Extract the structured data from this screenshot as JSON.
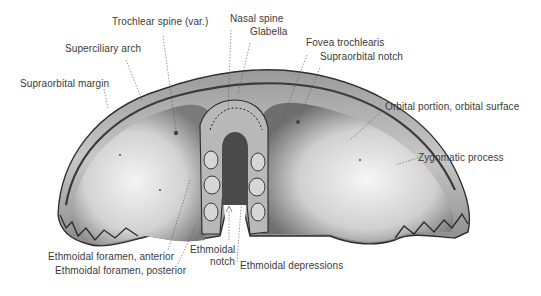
{
  "figure": {
    "labels": [
      {
        "id": "trochlear-spine",
        "text": "Trochlear spine (var.)",
        "x": 112,
        "y": 21
      },
      {
        "id": "nasal-spine",
        "text": "Nasal spine",
        "x": 232,
        "y": 18
      },
      {
        "id": "glabella",
        "text": "Glabella",
        "x": 250,
        "y": 31
      },
      {
        "id": "superciliary-arch",
        "text": "Superciliary arch",
        "x": 65,
        "y": 48
      },
      {
        "id": "fovea-trochlearis",
        "text": "Fovea trochlearis",
        "x": 306,
        "y": 42
      },
      {
        "id": "supraorbital-notch",
        "text": "Supraorbital notch",
        "x": 320,
        "y": 56
      },
      {
        "id": "supraorbital-margin",
        "text": "Supraorbital margin",
        "x": 20,
        "y": 78
      },
      {
        "id": "orbital-portion",
        "text": "Orbital portion, orbital surface",
        "x": 385,
        "y": 103
      },
      {
        "id": "zygomatic-process",
        "text": "Zygomatic process",
        "x": 419,
        "y": 152
      },
      {
        "id": "ethmoidal-foramen-anterior",
        "text": "Ethmoidal foramen, anterior",
        "x": 48,
        "y": 251
      },
      {
        "id": "ethmoidal-notch-1",
        "text": "Ethmoidal",
        "x": 190,
        "y": 244
      },
      {
        "id": "ethmoidal-notch-2",
        "text": "notch",
        "x": 210,
        "y": 256
      },
      {
        "id": "ethmoidal-foramen-posterior",
        "text": "Ethmoidal foramen, posterior",
        "x": 55,
        "y": 265
      },
      {
        "id": "ethmoidal-depressions",
        "text": "Ethmoidal depressions",
        "x": 240,
        "y": 260
      }
    ]
  }
}
